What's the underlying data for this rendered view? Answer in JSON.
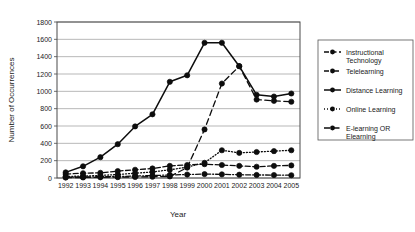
{
  "chart_data": {
    "type": "line",
    "title": "",
    "xlabel": "Year",
    "ylabel": "Number of Occurrences",
    "categories": [
      1992,
      1993,
      1994,
      1995,
      1996,
      1997,
      1998,
      1999,
      2000,
      2001,
      2002,
      2003,
      2004,
      2005
    ],
    "xtick_labels": [
      "1992",
      "1993",
      "1994",
      "1995",
      "1996",
      "1997",
      "1998",
      "1999",
      "2000",
      "2001",
      "2002",
      "2003",
      "2004",
      "2005"
    ],
    "ytick_labels": [
      "0",
      "200",
      "400",
      "600",
      "800",
      "1000",
      "1200",
      "1400",
      "1600",
      "1800"
    ],
    "ylim": [
      0,
      1800
    ],
    "ytick_step": 200,
    "grid": true,
    "legend_position": "right",
    "series": [
      {
        "name": "Instructional Technology",
        "style": "dashed",
        "marker": "circle-filled",
        "values": [
          45,
          55,
          60,
          80,
          95,
          110,
          140,
          150,
          160,
          150,
          140,
          130,
          140,
          145
        ]
      },
      {
        "name": "Telelearning",
        "style": "dash-dot",
        "marker": "circle-filled",
        "values": [
          10,
          12,
          15,
          18,
          22,
          28,
          35,
          40,
          45,
          42,
          38,
          35,
          34,
          32
        ]
      },
      {
        "name": "Distance Learning",
        "style": "solid",
        "marker": "circle-filled",
        "values": [
          65,
          135,
          240,
          390,
          595,
          735,
          1110,
          1185,
          1560,
          1560,
          1290,
          960,
          940,
          975
        ]
      },
      {
        "name": "Online Learning",
        "style": "dotted",
        "marker": "circle-filled",
        "values": [
          18,
          22,
          30,
          40,
          55,
          70,
          95,
          125,
          175,
          320,
          290,
          300,
          310,
          320
        ]
      },
      {
        "name": "E-learning OR Elearning",
        "style": "long-dash",
        "marker": "circle-filled",
        "values": [
          5,
          6,
          8,
          10,
          12,
          15,
          18,
          120,
          560,
          1090,
          1290,
          905,
          890,
          880
        ]
      }
    ]
  },
  "legend": {
    "entries": [
      {
        "label_line1": "Instructional",
        "label_line2": "Technology"
      },
      {
        "label_line1": "Telelearning",
        "label_line2": ""
      },
      {
        "label_line1": "Distance Learning",
        "label_line2": ""
      },
      {
        "label_line1": "Online Learning",
        "label_line2": ""
      },
      {
        "label_line1": "E-learning OR",
        "label_line2": "Elearning"
      }
    ]
  },
  "colors": {
    "ink": "#0d0d0d",
    "grid": "#9a9a9a",
    "frame": "#4a4a4a",
    "background": "#ffffff"
  }
}
